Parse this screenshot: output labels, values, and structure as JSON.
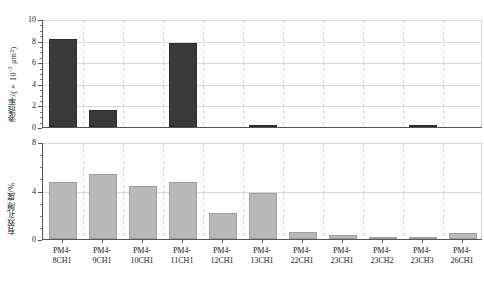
{
  "chart_data": {
    "type": "bar",
    "title": "",
    "layout": "two stacked panels sharing a common category axis",
    "categories": [
      "PM4-\n8CH1",
      "PM4-\n9CH1",
      "PM4-\n10CH1",
      "PM4-\n11CH1",
      "PM4-\n12CH1",
      "PM4-\n13CH1",
      "PM4-\n22CH1",
      "PM4-\n23CH1",
      "PM4-\n23CH2",
      "PM4-\n23CH3",
      "PM4-\n26CH1"
    ],
    "categories_plain": [
      "PM4-8CH1",
      "PM4-9CH1",
      "PM4-10CH1",
      "PM4-11CH1",
      "PM4-12CH1",
      "PM4-13CH1",
      "PM4-22CH1",
      "PM4-23CH1",
      "PM4-23CH2",
      "PM4-23CH3",
      "PM4-26CH1"
    ],
    "panels": [
      {
        "id": "permeability",
        "ylabel": "渗透率/(×10⁻³ μm²)",
        "ylabel_main": "渗透率/(×10",
        "ylabel_exp": "-3",
        "ylabel_tail": " μm²)",
        "ylim": [
          0,
          10
        ],
        "yticks": [
          0,
          2,
          4,
          6,
          8,
          10
        ],
        "ytick_labels": [
          "0",
          "2",
          "4",
          "6",
          "8",
          "10"
        ],
        "yminor_step": 0.5,
        "grid": true,
        "bar_color": "#3a3a3a",
        "values": [
          8.12,
          1.62,
          0.0,
          7.78,
          0.0,
          0.16,
          0.0,
          0.0,
          0.0,
          0.06,
          0.0
        ]
      },
      {
        "id": "effective-porosity",
        "ylabel": "有效孔隙度/%",
        "ylim": [
          0,
          8
        ],
        "yticks": [
          0,
          4,
          8
        ],
        "ytick_labels": [
          "0",
          "4",
          "8"
        ],
        "yminor_step": 1,
        "grid": true,
        "bar_color": "#b9b9b9",
        "values": [
          4.72,
          5.38,
          4.38,
          4.72,
          2.12,
          3.82,
          0.55,
          0.3,
          0.14,
          0.06,
          0.46
        ]
      }
    ],
    "xlabel": "",
    "legend": null
  },
  "figure": {
    "background": "#ffffff",
    "axis_color": "#555555",
    "grid_color": "#d9d9d9"
  }
}
